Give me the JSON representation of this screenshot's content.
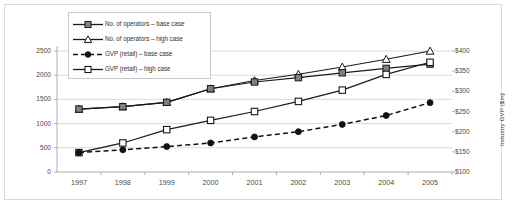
{
  "chart_data": {
    "type": "line",
    "title": "",
    "subtitle": "",
    "xlabel": "",
    "ylabel": "No. of operators",
    "y2label": "Industry GVP ($m)",
    "categories": [
      "1997",
      "1998",
      "1999",
      "2000",
      "2001",
      "2002",
      "2003",
      "2004",
      "2005"
    ],
    "x": [
      1997,
      1998,
      1999,
      2000,
      2001,
      2002,
      2003,
      2004,
      2005
    ],
    "ylim": [
      0,
      2500
    ],
    "y2lim": [
      100,
      400
    ],
    "yticks": [
      "0",
      "500",
      "1000",
      "1500",
      "2000",
      "2500"
    ],
    "ytick_values": [
      0,
      500,
      1000,
      1500,
      2000,
      2500
    ],
    "y2ticks": [
      "$100",
      "$150",
      "$200",
      "$250",
      "$300",
      "$350",
      "$400"
    ],
    "y2tick_values": [
      100,
      150,
      200,
      250,
      300,
      350,
      400
    ],
    "grid": true,
    "grid_axis": "y",
    "legend_position": "upper-left-inside",
    "series": [
      {
        "name": "No. of operators – base case",
        "axis": "left",
        "marker": "filled-square",
        "marker_color": "#808080",
        "line_style": "solid",
        "line_color": "#1a1a1a",
        "values": [
          1300,
          1350,
          1440,
          1720,
          1860,
          1950,
          2050,
          2140,
          2230
        ]
      },
      {
        "name": "No. of operators – high case",
        "axis": "left",
        "marker": "open-triangle",
        "marker_color": "#ffffff",
        "line_style": "solid",
        "line_color": "#1a1a1a",
        "values": [
          1300,
          1350,
          1440,
          1720,
          1890,
          2020,
          2170,
          2330,
          2500
        ]
      },
      {
        "name": "GVP (retail) – base case",
        "axis": "right",
        "marker": "filled-circle",
        "marker_color": "#111111",
        "line_style": "dashed",
        "line_color": "#111111",
        "values": [
          148,
          155,
          163,
          172,
          187,
          200,
          218,
          240,
          272
        ]
      },
      {
        "name": "GVP (retail) – high case",
        "axis": "right",
        "marker": "open-square",
        "marker_color": "#ffffff",
        "line_style": "solid",
        "line_color": "#1a1a1a",
        "values": [
          148,
          172,
          205,
          228,
          250,
          275,
          303,
          342,
          372
        ]
      }
    ]
  },
  "axes": {
    "left_title": "No. of operators",
    "right_title": "Industry GVP ($m)"
  },
  "legend": {
    "items": [
      {
        "label": "No. of operators – base case"
      },
      {
        "label": "No. of operators – high case"
      },
      {
        "label": "GVP (retail) – base case"
      },
      {
        "label": "GVP (retail) – high case"
      }
    ]
  },
  "colors": {
    "frame_border": "#d9d9d9",
    "grid": "#d0d0d0",
    "axis_line": "#9a9a9a",
    "text": "#4a4a4a",
    "series_dark": "#1a1a1a",
    "series_gray_fill": "#808080"
  }
}
